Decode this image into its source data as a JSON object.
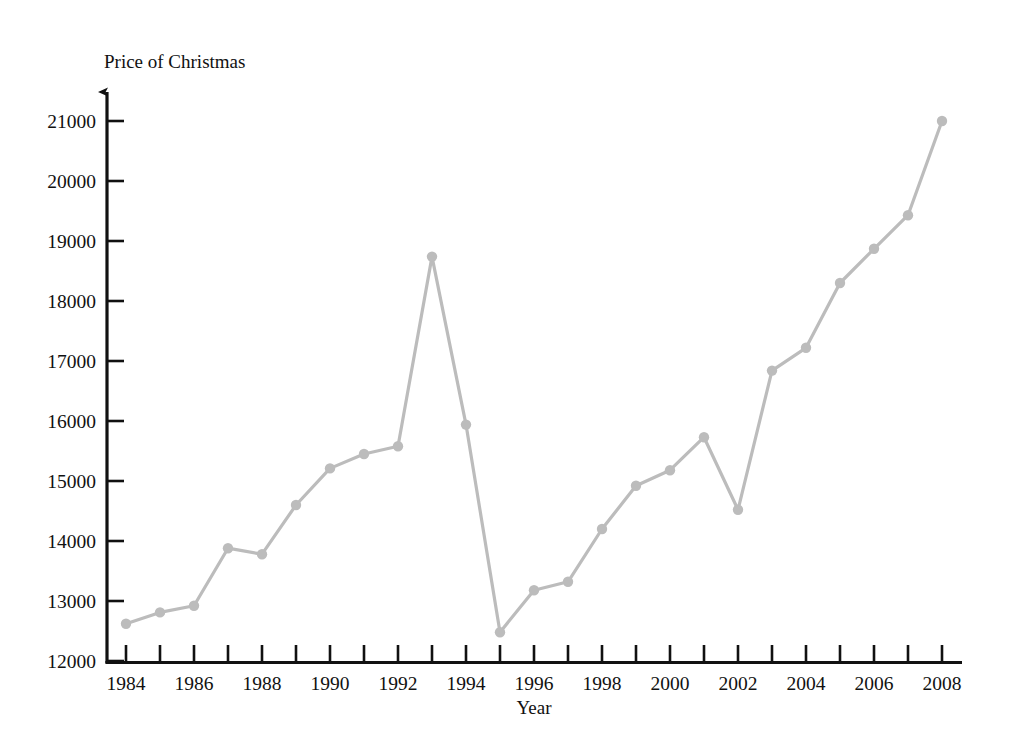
{
  "chart_data": {
    "type": "line",
    "title": "",
    "xlabel": "Year",
    "ylabel": "Price of Christmas",
    "y_axis_title": "Price of Christmas",
    "x_axis_title": "Year",
    "grid": false,
    "legend": "none",
    "xlim": [
      1983.5,
      2008.8
    ],
    "ylim": [
      12000,
      21400
    ],
    "x_tick_labels": [
      "1984",
      "1986",
      "1988",
      "1990",
      "1992",
      "1994",
      "1996",
      "1998",
      "2000",
      "2002",
      "2004",
      "2006",
      "2008"
    ],
    "x_tick_values": [
      1984,
      1986,
      1988,
      1990,
      1992,
      1994,
      1996,
      1998,
      2000,
      2002,
      2004,
      2006,
      2008
    ],
    "x_minor_tick_values": [
      1985,
      1987,
      1989,
      1991,
      1993,
      1995,
      1997,
      1999,
      2001,
      2003,
      2005,
      2007
    ],
    "y_tick_labels": [
      "12000",
      "13000",
      "14000",
      "15000",
      "16000",
      "17000",
      "18000",
      "19000",
      "20000",
      "21000"
    ],
    "y_tick_values": [
      12000,
      13000,
      14000,
      15000,
      16000,
      17000,
      18000,
      19000,
      20000,
      21000
    ],
    "categories": [
      1984,
      1985,
      1986,
      1987,
      1988,
      1989,
      1990,
      1991,
      1992,
      1993,
      1994,
      1995,
      1996,
      1997,
      1998,
      1999,
      2000,
      2001,
      2002,
      2003,
      2004,
      2005,
      2006,
      2007,
      2008
    ],
    "values": [
      12620,
      12810,
      12920,
      13880,
      13780,
      14600,
      15210,
      15450,
      15580,
      18740,
      15940,
      12480,
      13180,
      13320,
      14200,
      14920,
      15180,
      15730,
      14520,
      16840,
      17220,
      18300,
      18870,
      19430,
      21000
    ],
    "series": [
      {
        "name": "Price of Christmas",
        "color": "#bcbcbc",
        "marker": "circle",
        "values": [
          12620,
          12810,
          12920,
          13880,
          13780,
          14600,
          15210,
          15450,
          15580,
          18740,
          15940,
          12480,
          13180,
          13320,
          14200,
          14920,
          15180,
          15730,
          14520,
          16840,
          17220,
          18300,
          18870,
          19430,
          21000
        ]
      }
    ],
    "colors": {
      "line": "#bcbcbc",
      "marker": "#bcbcbc",
      "axis": "#111111",
      "text": "#111111",
      "background": "#ffffff"
    }
  }
}
